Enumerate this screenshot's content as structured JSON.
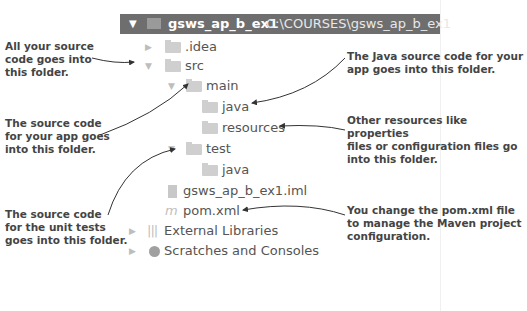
{
  "project": {
    "name": "gsws_ap_b_ex1",
    "path": "C:\\COURSES\\gsws_ap_b_ex1",
    "expanded": true
  },
  "tree": [
    {
      "label": ".idea",
      "type": "folder",
      "expanded": false
    },
    {
      "label": "src",
      "type": "folder",
      "expanded": true
    },
    {
      "label": "main",
      "type": "folder",
      "expanded": true
    },
    {
      "label": "java",
      "type": "source-folder"
    },
    {
      "label": "resources",
      "type": "resources-folder"
    },
    {
      "label": "test",
      "type": "folder",
      "expanded": true
    },
    {
      "label": "java",
      "type": "test-source-folder"
    },
    {
      "label": "gsws_ap_b_ex1.iml",
      "type": "iml-file"
    },
    {
      "label": "pom.xml",
      "type": "maven-file"
    },
    {
      "label": "External Libraries",
      "type": "libraries",
      "expanded": false
    },
    {
      "label": "Scratches and Consoles",
      "type": "scratches",
      "expanded": false
    }
  ],
  "annotations": {
    "src": "All your source code goes into this folder.",
    "main": "The source code for your app goes into this folder.",
    "test": "The source code for the unit tests goes into this folder.",
    "java": "The Java source code for your app goes into this folder.",
    "resources": "Other resources like properties files or configuration files go into this folder.",
    "pom": "You change the pom.xml file to manage the Maven project configuration."
  },
  "annotation_lines": {
    "src": [
      "All your source",
      "code goes into",
      "this folder."
    ],
    "main": [
      "The source code",
      "for your app goes",
      "into this folder."
    ],
    "test": [
      "The source code",
      "for the unit tests",
      "goes into this folder."
    ],
    "java": [
      "The Java source code for your",
      "app goes into this folder."
    ],
    "resources": [
      "Other resources like properties",
      "files or configuration files go",
      "into this folder."
    ],
    "pom": [
      "You change the pom.xml file",
      "to manage the Maven project",
      "configuration."
    ]
  }
}
